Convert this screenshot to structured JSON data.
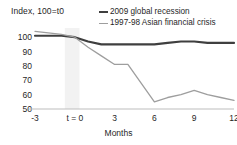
{
  "chart_data": {
    "type": "line",
    "title": "",
    "ylabel": "Index, 100=t0",
    "xlabel": "Months",
    "x": [
      -3,
      -2,
      -1,
      0,
      1,
      2,
      3,
      4,
      5,
      6,
      7,
      8,
      9,
      10,
      11,
      12
    ],
    "xticks": [
      "-3",
      "t = 0",
      "3",
      "6",
      "9",
      "12"
    ],
    "xtick_values": [
      -3,
      0,
      3,
      6,
      9,
      12
    ],
    "yticks": [
      "100",
      "90",
      "80",
      "70",
      "60",
      "50"
    ],
    "ytick_values": [
      100,
      90,
      80,
      70,
      60,
      50
    ],
    "ylim": [
      50,
      105
    ],
    "xlim": [
      -3,
      12
    ],
    "grid": false,
    "legend_position": "top-right",
    "series": [
      {
        "name": "2009 global recession",
        "color": "#3f3f3f",
        "values": [
          101,
          101,
          101,
          100,
          97,
          95,
          95,
          95,
          95,
          95,
          96,
          97,
          97,
          96,
          96,
          96
        ]
      },
      {
        "name": "1997-98 Asian financial crisis",
        "color": "#9e9e9e",
        "values": [
          104,
          103,
          102,
          100,
          93,
          87,
          81,
          81,
          68,
          55,
          58,
          60,
          63,
          60,
          58,
          56
        ]
      }
    ]
  },
  "legend": {
    "items": [
      {
        "label": "2009 global recession"
      },
      {
        "label": "1997-98 Asian financial crisis"
      }
    ]
  }
}
